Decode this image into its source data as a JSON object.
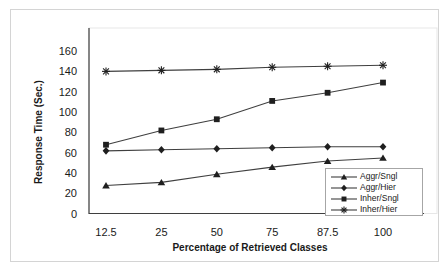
{
  "figure": {
    "background": "#ffffff",
    "frame_color": "#d4d4d4",
    "legend_border_color": "#a6a6a6"
  },
  "chart_data": {
    "type": "line",
    "title": "",
    "xlabel": "Percentage of Retrieved Classes",
    "ylabel": "Response Time (Sec.)",
    "categories": [
      "12.5",
      "25",
      "50",
      "75",
      "87.5",
      "100"
    ],
    "y_ticks": [
      0,
      20,
      40,
      60,
      80,
      100,
      120,
      140,
      160
    ],
    "ylim": [
      0,
      160
    ],
    "grid": false,
    "legend_position": "inside-bottom-right",
    "series": [
      {
        "name": "Aggr/Sngl",
        "marker": "triangle",
        "values": [
          28,
          31,
          39,
          46,
          52,
          55
        ]
      },
      {
        "name": "Aggr/Hier",
        "marker": "diamond",
        "values": [
          62,
          63,
          64,
          65,
          66,
          66
        ]
      },
      {
        "name": "Inher/Sngl",
        "marker": "square",
        "values": [
          68,
          82,
          93,
          111,
          119,
          129
        ]
      },
      {
        "name": "Inher/Hier",
        "marker": "asterisk",
        "values": [
          140,
          141,
          142,
          144,
          145,
          146
        ]
      }
    ],
    "line_color": "#3f3f3f",
    "marker_color": "#1f1f1f",
    "text_color": "#1a1a1a"
  }
}
